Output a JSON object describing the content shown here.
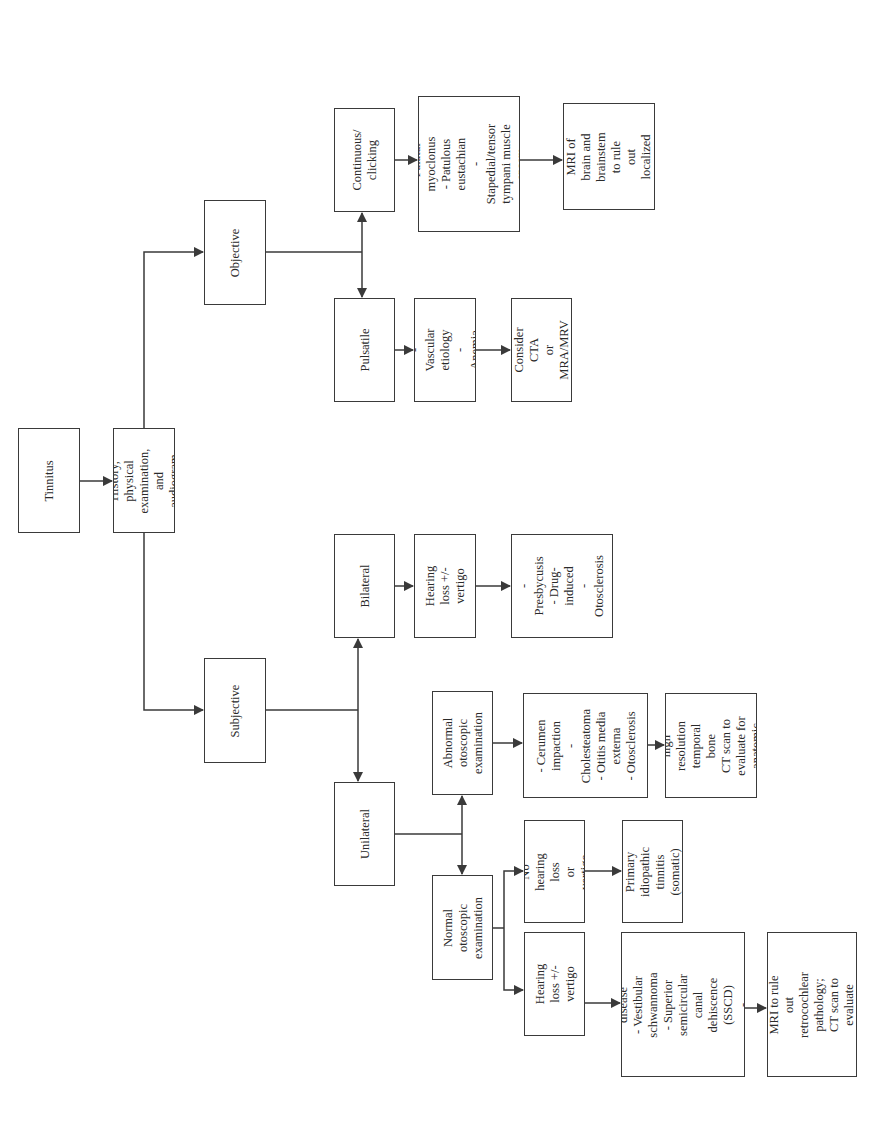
{
  "diagram": {
    "type": "flowchart",
    "orientation": "rotated 90deg counter-clockwise",
    "colors": {
      "stroke": "#3a3a3a",
      "background": "#ffffff",
      "text": "#2a2a2a"
    },
    "nodes": {
      "tinnitus": {
        "label": "Tinnitus",
        "x": 18,
        "y": 428,
        "w": 62,
        "h": 105
      },
      "history": {
        "label": "History, physical\nexamination,\nand audiogram",
        "x": 113,
        "y": 428,
        "w": 62,
        "h": 105
      },
      "objective": {
        "label": "Objective",
        "x": 204,
        "y": 200,
        "w": 62,
        "h": 105
      },
      "subjective": {
        "label": "Subjective",
        "x": 204,
        "y": 658,
        "w": 62,
        "h": 105
      },
      "continuous": {
        "label": "Continuous/\nclicking",
        "x": 334,
        "y": 108,
        "w": 61,
        "h": 104
      },
      "continuous_causes": {
        "label": "- Palatal myoclonus\n- Patulous eustachian\n- Stapedial/tensor\ntympani muscle\nspasm",
        "x": 418,
        "y": 96,
        "w": 102,
        "h": 136
      },
      "mri_brain": {
        "label": "Consider MRI of\nbrain and\nbrainstem to rule\nout localized\nlesion",
        "x": 563,
        "y": 103,
        "w": 92,
        "h": 107
      },
      "pulsatile": {
        "label": "Pulsatile",
        "x": 334,
        "y": 298,
        "w": 61,
        "h": 104
      },
      "pulsatile_causes": {
        "label": "- Vascular\netiology\n- Anemia",
        "x": 414,
        "y": 298,
        "w": 62,
        "h": 104
      },
      "cta": {
        "label": "Consider CTA\nor MRA/MRV",
        "x": 511,
        "y": 298,
        "w": 61,
        "h": 104
      },
      "bilateral": {
        "label": "Bilateral",
        "x": 334,
        "y": 534,
        "w": 61,
        "h": 104
      },
      "bilateral_hearing": {
        "label": "Hearing loss +/-\nvertigo",
        "x": 414,
        "y": 534,
        "w": 62,
        "h": 104
      },
      "bilateral_causes": {
        "label": "- Presbycusis\n- Drug-induced\n- Otosclerosis",
        "x": 511,
        "y": 534,
        "w": 102,
        "h": 104
      },
      "unilateral": {
        "label": "Unilateral",
        "x": 334,
        "y": 782,
        "w": 61,
        "h": 104
      },
      "abnormal_otoscopic": {
        "label": "Abnormal\notoscopic\nexamination",
        "x": 432,
        "y": 691,
        "w": 61,
        "h": 104
      },
      "abnormal_causes": {
        "label": "- Cerumen\nimpaction\n- Cholesteatoma\n- Otitis media\nexterna\n- Otosclerosis",
        "x": 523,
        "y": 693,
        "w": 125,
        "h": 105
      },
      "high_res_ct": {
        "label": "Consider high\nresolution\ntemporal bone\nCT scan to\nevaluate for\nanatomic\nabnormality",
        "x": 665,
        "y": 693,
        "w": 92,
        "h": 105
      },
      "normal_otoscopic": {
        "label": "Normal\notoscopic\nexamination",
        "x": 432,
        "y": 875,
        "w": 61,
        "h": 105
      },
      "no_hearing_loss": {
        "label": "No hearing loss\nor vertigo",
        "x": 524,
        "y": 820,
        "w": 61,
        "h": 103
      },
      "primary_idiopathic": {
        "label": "Primary\nidiopathic\ntinnitis (somatic)",
        "x": 622,
        "y": 820,
        "w": 61,
        "h": 103
      },
      "unilateral_hearing": {
        "label": "Hearing loss +/-\nvertigo",
        "x": 524,
        "y": 932,
        "w": 61,
        "h": 104
      },
      "unilateral_causes": {
        "label": "- Meniere's disease\n- Vestibular\nschwannoma\n- Superior semicircular\ncanal dehiscence\n(SSCD)\n- Otosclerosis",
        "x": 621,
        "y": 932,
        "w": 124,
        "h": 145
      },
      "mri_retrocochlear": {
        "label": "Consider MRI to rule\nout retrocochlear\npathology; CT scan to\nevaluate SSCD",
        "x": 767,
        "y": 932,
        "w": 90,
        "h": 145
      }
    },
    "edges": [
      {
        "from": "tinnitus",
        "to": "history"
      },
      {
        "from": "history",
        "to": "objective"
      },
      {
        "from": "history",
        "to": "subjective"
      },
      {
        "from": "objective",
        "to": "continuous"
      },
      {
        "from": "objective",
        "to": "pulsatile"
      },
      {
        "from": "continuous",
        "to": "continuous_causes"
      },
      {
        "from": "continuous_causes",
        "to": "mri_brain"
      },
      {
        "from": "pulsatile",
        "to": "pulsatile_causes"
      },
      {
        "from": "pulsatile_causes",
        "to": "cta"
      },
      {
        "from": "subjective",
        "to": "bilateral"
      },
      {
        "from": "subjective",
        "to": "unilateral"
      },
      {
        "from": "bilateral",
        "to": "bilateral_hearing"
      },
      {
        "from": "bilateral_hearing",
        "to": "bilateral_causes"
      },
      {
        "from": "unilateral",
        "to": "abnormal_otoscopic"
      },
      {
        "from": "unilateral",
        "to": "normal_otoscopic"
      },
      {
        "from": "abnormal_otoscopic",
        "to": "abnormal_causes"
      },
      {
        "from": "abnormal_causes",
        "to": "high_res_ct"
      },
      {
        "from": "normal_otoscopic",
        "to": "no_hearing_loss"
      },
      {
        "from": "normal_otoscopic",
        "to": "unilateral_hearing"
      },
      {
        "from": "no_hearing_loss",
        "to": "primary_idiopathic"
      },
      {
        "from": "unilateral_hearing",
        "to": "unilateral_causes"
      },
      {
        "from": "unilateral_causes",
        "to": "mri_retrocochlear"
      }
    ]
  }
}
